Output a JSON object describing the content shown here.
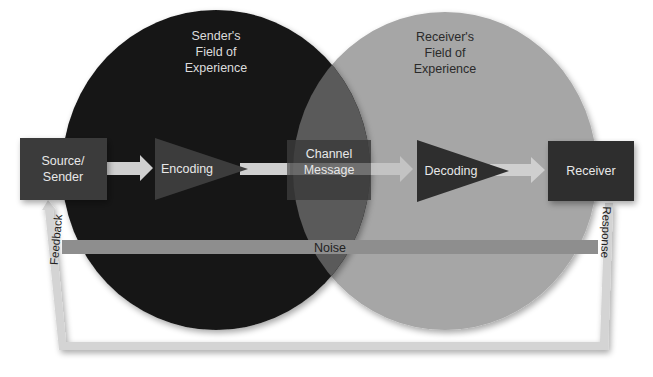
{
  "diagram": {
    "fields": {
      "sender": [
        "Sender's",
        "Field of",
        "Experience"
      ],
      "receiver": [
        "Receiver's",
        "Field of",
        "Experience"
      ]
    },
    "nodes": {
      "source": [
        "Source/",
        "Sender"
      ],
      "encoding": "Encoding",
      "channel": [
        "Channel",
        "Message"
      ],
      "decoding": "Decoding",
      "receiver": "Receiver"
    },
    "noise": "Noise",
    "feedback": "Feedback",
    "response": "Response",
    "colors": {
      "sender_field": "#141414",
      "receiver_field": "#a6a6a6",
      "overlap": "#5a5a5a",
      "box": "#3a3a3a",
      "triangle_dark": "#2e2e2e",
      "triangle_on_dark": "#3c3c3c",
      "arrow": "#cfcfcf",
      "noise_bar": "#8e8e8e",
      "loop": "#d4d4d4"
    }
  }
}
